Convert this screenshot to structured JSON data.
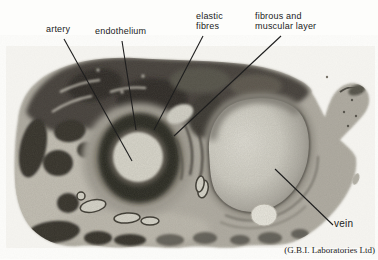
{
  "figure": {
    "labels": {
      "artery": "artery",
      "endothelium": "endothelium",
      "elastic_fibres": "elastic\nfibres",
      "fibrous_muscular": "fibrous and\nmuscular layer",
      "vein": "vein"
    },
    "credit": "(G.B.I. Laboratories Ltd)"
  },
  "colors": {
    "page_background": "#fdfdfb",
    "photo_background": "#f6f5f1",
    "tissue_base": "#b1ada3",
    "tissue_dark_mass": "#44413a",
    "tissue_blob_dark": "#34312c",
    "artery_adventitia": "#a6a298",
    "artery_wall_dark": "#2c2924",
    "artery_lumen": "#d8d6cb",
    "vein_wall": "#908c82",
    "vein_lumen_light": "#dedcd3",
    "label_text": "#1b1b1b",
    "leader_line": "#1e1e1e"
  }
}
